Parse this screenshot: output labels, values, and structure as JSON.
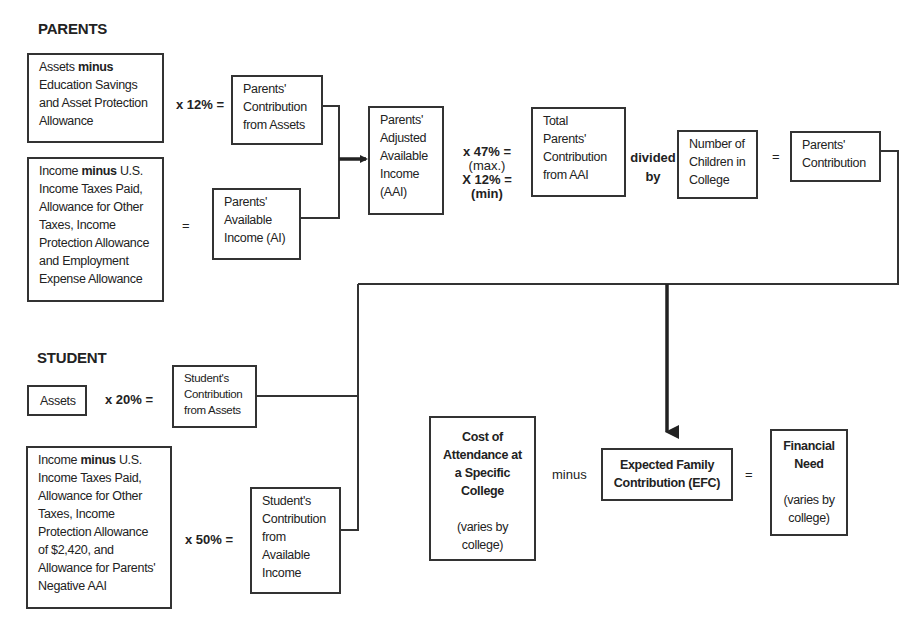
{
  "diagram": {
    "sections": {
      "parents": "PARENTS",
      "student": "STUDENT"
    },
    "parents": {
      "assets_box": {
        "lines": [
          "Assets",
          "minus",
          "Education Savings",
          "and Asset Protection",
          "Allowance"
        ]
      },
      "op_assets": "x  12% =",
      "contribution_assets": {
        "lines": [
          "Parents'",
          "Contribution",
          "from Assets"
        ]
      },
      "income_box": {
        "lines": [
          "Income",
          "minus",
          "U.S.",
          "Income Taxes Paid,",
          "Allowance for Other",
          "Taxes, Income",
          "Protection Allowance",
          "and Employment",
          "Expense Allowance"
        ]
      },
      "op_income": "=",
      "available_income": {
        "lines": [
          "Parents'",
          "Available",
          "Income (AI)"
        ]
      },
      "aai": {
        "lines": [
          "Parents'",
          "Adjusted",
          "Available",
          "Income",
          "(AAI)"
        ]
      },
      "op_aai": {
        "max_rate": "x  47% =",
        "max_label": "(max.)",
        "min_rate": "X  12% =",
        "min_label": "(min)"
      },
      "total_contribution_aai": {
        "lines": [
          "Total",
          "Parents'",
          "Contribution",
          "from AAI"
        ]
      },
      "op_divided": {
        "line1": "divided",
        "line2": "by"
      },
      "children_in_college": {
        "lines": [
          "Number of",
          "Children in",
          "College"
        ]
      },
      "op_equals": "=",
      "parents_contribution": {
        "lines": [
          "Parents'",
          "Contribution"
        ]
      }
    },
    "student": {
      "assets_box": {
        "label": "Assets"
      },
      "op_assets": "x  20% =",
      "contribution_assets": {
        "lines": [
          "Student's",
          "Contribution",
          "from Assets"
        ]
      },
      "income_box": {
        "lines": [
          "Income",
          "minus",
          "U.S.",
          "Income Taxes Paid,",
          "Allowance for Other",
          "Taxes, Income",
          "Protection Allowance",
          "of $2,420, and",
          "Allowance for Parents'",
          "Negative AAI"
        ]
      },
      "op_income": "x  50% =",
      "contribution_income": {
        "lines": [
          "Student's",
          "Contribution",
          "from",
          "Available",
          "Income"
        ]
      }
    },
    "result": {
      "cost_of_attendance": {
        "title_lines": [
          "Cost of",
          "Attendance at",
          "a Specific",
          "College"
        ],
        "note_lines": [
          "(varies by",
          "college)"
        ]
      },
      "op_minus": "minus",
      "efc": {
        "lines": [
          "Expected Family",
          "Contribution (EFC)"
        ]
      },
      "op_equals": "=",
      "financial_need": {
        "title_lines": [
          "Financial",
          "Need"
        ],
        "note_lines": [
          "(varies by",
          "college)"
        ]
      }
    },
    "colors": {
      "line": "#333333",
      "text": "#222222",
      "background": "#ffffff"
    }
  }
}
